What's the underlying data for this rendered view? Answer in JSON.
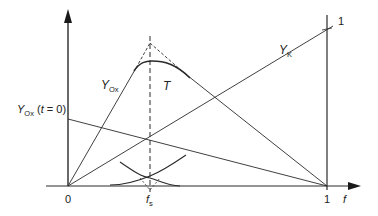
{
  "diagram": {
    "type": "function-plot-diagram",
    "axes": {
      "x_label": "f",
      "x_ticks": [
        "0",
        "f_s",
        "1"
      ],
      "y_tick_right": "1"
    },
    "labels": {
      "y_ox": {
        "main": "Y",
        "sub": "Ox"
      },
      "y_k": {
        "main": "Y",
        "sub": "K"
      },
      "t_curve": "T",
      "y_ox_t0": {
        "main": "Y",
        "sub": "Ox",
        "suffix_open": " (",
        "t": "t",
        "eq": " = 0)"
      },
      "origin": "0",
      "fs": {
        "main": "f",
        "sub": "s"
      },
      "one_x": "1",
      "f_axis": "f",
      "one_y": "1"
    },
    "colors": {
      "line": "#2a2a2a",
      "background": "#ffffff"
    }
  }
}
